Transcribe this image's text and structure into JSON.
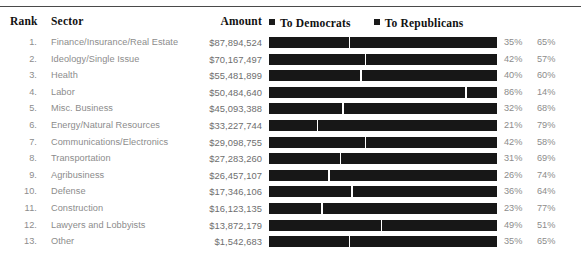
{
  "table": {
    "headers": {
      "rank": "Rank",
      "sector": "Sector",
      "amount": "Amount"
    },
    "legend": [
      {
        "label": "To Democrats",
        "swatch_color": "#1a1a1a",
        "icon": "square-swatch-icon"
      },
      {
        "label": "To Republicans",
        "swatch_color": "#1a1a1a",
        "icon": "square-swatch-icon"
      }
    ],
    "rows": [
      {
        "rank": "1.",
        "sector": "Finance/Insurance/Real Estate",
        "amount": "$87,894,524",
        "dem_pct": "35%",
        "rep_pct": "65%",
        "dem_value": 35
      },
      {
        "rank": "2.",
        "sector": "Ideology/Single Issue",
        "amount": "$70,167,497",
        "dem_pct": "42%",
        "rep_pct": "57%",
        "dem_value": 42
      },
      {
        "rank": "3.",
        "sector": "Health",
        "amount": "$55,481,899",
        "dem_pct": "40%",
        "rep_pct": "60%",
        "dem_value": 40
      },
      {
        "rank": "4.",
        "sector": "Labor",
        "amount": "$50,484,640",
        "dem_pct": "86%",
        "rep_pct": "14%",
        "dem_value": 86
      },
      {
        "rank": "5.",
        "sector": "Misc. Business",
        "amount": "$45,093,388",
        "dem_pct": "32%",
        "rep_pct": "68%",
        "dem_value": 32
      },
      {
        "rank": "6.",
        "sector": "Energy/Natural Resources",
        "amount": "$33,227,744",
        "dem_pct": "21%",
        "rep_pct": "79%",
        "dem_value": 21
      },
      {
        "rank": "7.",
        "sector": "Communications/Electronics",
        "amount": "$29,098,755",
        "dem_pct": "42%",
        "rep_pct": "58%",
        "dem_value": 42
      },
      {
        "rank": "8.",
        "sector": "Transportation",
        "amount": "$27,283,260",
        "dem_pct": "31%",
        "rep_pct": "69%",
        "dem_value": 31
      },
      {
        "rank": "9.",
        "sector": "Agribusiness",
        "amount": "$26,457,107",
        "dem_pct": "26%",
        "rep_pct": "74%",
        "dem_value": 26
      },
      {
        "rank": "10.",
        "sector": "Defense",
        "amount": "$17,346,106",
        "dem_pct": "36%",
        "rep_pct": "64%",
        "dem_value": 36
      },
      {
        "rank": "11.",
        "sector": "Construction",
        "amount": "$16,123,135",
        "dem_pct": "23%",
        "rep_pct": "77%",
        "dem_value": 23
      },
      {
        "rank": "12.",
        "sector": "Lawyers and Lobbyists",
        "amount": "$13,872,179",
        "dem_pct": "49%",
        "rep_pct": "51%",
        "dem_value": 49
      },
      {
        "rank": "13.",
        "sector": "Other",
        "amount": "$1,542,683",
        "dem_pct": "35%",
        "rep_pct": "65%",
        "dem_value": 35
      }
    ]
  },
  "chart_data": {
    "type": "bar",
    "title": "",
    "xlabel": "",
    "ylabel": "",
    "orientation": "horizontal",
    "stacked": true,
    "grid": false,
    "legend_position": "top-right",
    "categories": [
      "Finance/Insurance/Real Estate",
      "Ideology/Single Issue",
      "Health",
      "Labor",
      "Misc. Business",
      "Energy/Natural Resources",
      "Communications/Electronics",
      "Transportation",
      "Agribusiness",
      "Defense",
      "Construction",
      "Lawyers and Lobbyists",
      "Other"
    ],
    "series": [
      {
        "name": "To Democrats",
        "values": [
          35,
          42,
          40,
          86,
          32,
          21,
          42,
          31,
          26,
          36,
          23,
          49,
          35
        ]
      },
      {
        "name": "To Republicans",
        "values": [
          65,
          57,
          60,
          14,
          68,
          79,
          58,
          69,
          74,
          64,
          77,
          51,
          65
        ]
      }
    ],
    "amounts": [
      87894524,
      70167497,
      55481899,
      50484640,
      45093388,
      33227744,
      29098755,
      27283260,
      26457107,
      17346106,
      16123135,
      13872179,
      1542683
    ],
    "xlim": [
      0,
      100
    ]
  }
}
